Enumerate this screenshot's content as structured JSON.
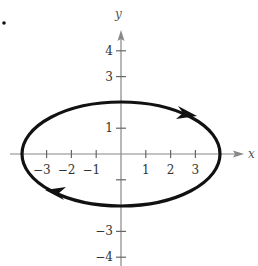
{
  "chart_data": {
    "type": "line",
    "title": "",
    "xlabel": "x",
    "ylabel": "y",
    "curve": {
      "name": "ellipse",
      "equation": "x^2/16 + y^2/4 = 1",
      "center": [
        0,
        0
      ],
      "semi_axis_x": 4,
      "semi_axis_y": 2,
      "orientation": "clockwise",
      "arrows": [
        {
          "at": [
            2.8,
            1.45
          ],
          "direction": "right-down"
        },
        {
          "at": [
            -2.5,
            -1.55
          ],
          "direction": "left-up"
        }
      ]
    },
    "x_ticks": [
      -3,
      -2,
      -1,
      1,
      2,
      3
    ],
    "x_tick_labels": [
      "−3",
      "−2",
      "−1",
      "1",
      "2",
      "3"
    ],
    "y_ticks": [
      4,
      3,
      1,
      -1,
      -3,
      -4
    ],
    "y_tick_labels": {
      "4": "4",
      "3": "3",
      "1": "1",
      "-3": "−3",
      "-4": "−4"
    },
    "xlim": [
      -4.3,
      5
    ],
    "ylim": [
      -4.4,
      4.8
    ],
    "grid": false,
    "legend": null,
    "marker": "•"
  },
  "layout": {
    "origin_px": [
      121,
      154
    ],
    "unit_px_x": 24.8,
    "unit_px_y": 25.8
  }
}
